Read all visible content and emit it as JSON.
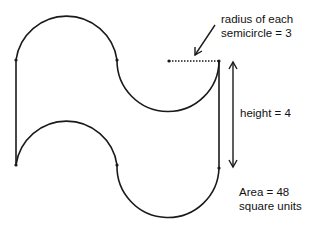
{
  "diagram": {
    "type": "geometry-figure",
    "labels": {
      "radius_line1": "radius of each",
      "radius_line2": "semicircle = 3",
      "height": "height = 4",
      "area_line1": "Area = 48",
      "area_line2": "square units"
    },
    "values": {
      "radius": 3,
      "height": 4,
      "area": 48
    },
    "colors": {
      "stroke": "#1a1a1a",
      "text": "#111111",
      "background": "#ffffff"
    }
  }
}
